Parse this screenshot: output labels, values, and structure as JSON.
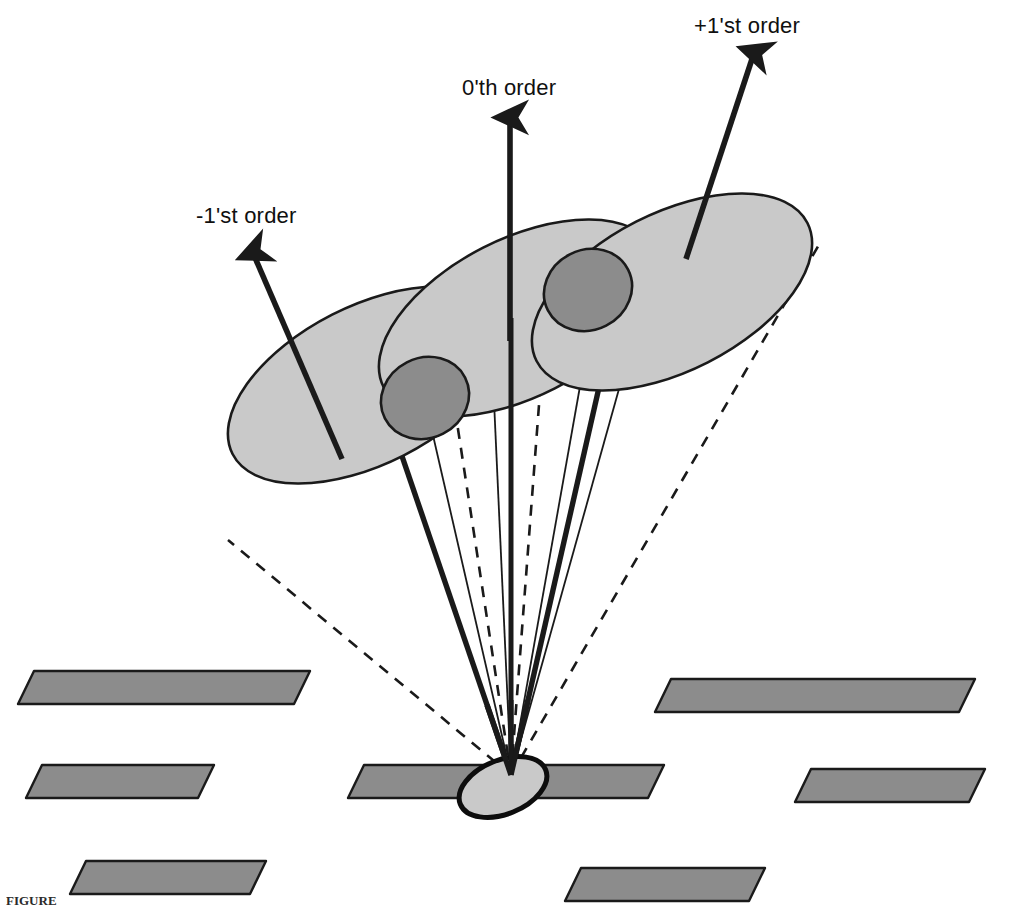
{
  "figure": {
    "domain": "diagram",
    "kind": "optical-diffraction-grating-orders",
    "background_color": "#ffffff",
    "width": 1016,
    "height": 909,
    "caption": "FIGURE"
  },
  "palette": {
    "ink": "#1a1a1a",
    "beam_ellipse_fill": "#c9c9c9",
    "beam_ellipse_stroke": "#1a1a1a",
    "overlap_circle_fill": "#8c8c8c",
    "overlap_circle_stroke": "#1a1a1a",
    "grating_bar_fill": "#8c8c8c",
    "grating_bar_stroke": "#1a1a1a",
    "source_spot_fill": "#c9c9c9",
    "source_spot_stroke": "#0d0d0d"
  },
  "labels": {
    "minus_first_order": "-1'st order",
    "zeroth_order": "0'th order",
    "plus_first_order": "+1'st order"
  },
  "orders": [
    {
      "id": "minus-1",
      "label": "-1'st order",
      "arrow": {
        "x1": 342,
        "y1": 459,
        "x2": 250,
        "y2": 246
      },
      "spot": {
        "cx": 368,
        "cy": 385,
        "rx": 152,
        "ry": 79,
        "rotate": -27
      }
    },
    {
      "id": "zero",
      "label": "0'th order",
      "arrow": {
        "x1": 510,
        "y1": 341,
        "x2": 510,
        "y2": 111
      },
      "spot": {
        "cx": 519,
        "cy": 318,
        "rx": 152,
        "ry": 79,
        "rotate": -27
      }
    },
    {
      "id": "plus-1",
      "label": "+1'st order",
      "arrow": {
        "x1": 686,
        "y1": 259,
        "x2": 757,
        "y2": 46
      },
      "spot": {
        "cx": 672,
        "cy": 292,
        "rx": 152,
        "ry": 79,
        "rotate": -27
      }
    }
  ],
  "overlap_circles": [
    {
      "id": "overlap-left",
      "cx": 425,
      "cy": 398,
      "rx": 45,
      "ry": 40,
      "rotate": -27
    },
    {
      "id": "overlap-right",
      "cx": 588,
      "cy": 290,
      "rx": 45,
      "ry": 40,
      "rotate": -27
    }
  ],
  "apex": {
    "x": 511,
    "y": 775
  },
  "source_spot": {
    "cx": 503,
    "cy": 787,
    "rx": 46,
    "ry": 27,
    "rotate": -22
  },
  "grating_bars": [
    {
      "id": "bar-1",
      "x": 18,
      "y": 671,
      "w": 292,
      "h": 33,
      "skew": 16
    },
    {
      "id": "bar-2",
      "x": 655,
      "y": 679,
      "w": 320,
      "h": 33,
      "skew": 16
    },
    {
      "id": "bar-3",
      "x": 26,
      "y": 765,
      "w": 188,
      "h": 33,
      "skew": 16
    },
    {
      "id": "bar-4",
      "x": 348,
      "y": 765,
      "w": 316,
      "h": 33,
      "skew": 16
    },
    {
      "id": "bar-5",
      "x": 795,
      "y": 769,
      "w": 190,
      "h": 33,
      "skew": 16
    },
    {
      "id": "bar-6",
      "x": 70,
      "y": 861,
      "w": 196,
      "h": 33,
      "skew": 16
    },
    {
      "id": "bar-7",
      "x": 565,
      "y": 868,
      "w": 200,
      "h": 33,
      "skew": 16
    }
  ],
  "cone_rays": {
    "thick_axes": [
      {
        "id": "axis-minus1",
        "x1": 511,
        "y1": 775,
        "x2": 377,
        "y2": 383
      },
      {
        "id": "axis-zero",
        "x1": 511,
        "y1": 775,
        "x2": 511,
        "y2": 318
      },
      {
        "id": "axis-plus1",
        "x1": 511,
        "y1": 775,
        "x2": 620,
        "y2": 295
      }
    ],
    "thin_edges": [
      {
        "id": "thin-minus1-right",
        "x1": 511,
        "y1": 775,
        "x2": 418,
        "y2": 370
      },
      {
        "id": "thin-zero-left",
        "x1": 511,
        "y1": 775,
        "x2": 492,
        "y2": 357
      },
      {
        "id": "thin-plus1-left",
        "x1": 511,
        "y1": 775,
        "x2": 590,
        "y2": 330
      },
      {
        "id": "thin-plus1-right",
        "x1": 511,
        "y1": 775,
        "x2": 645,
        "y2": 296
      }
    ],
    "dashed_edges": [
      {
        "id": "dash-far-left",
        "x1": 511,
        "y1": 775,
        "x2": 228,
        "y2": 540
      },
      {
        "id": "dash-mid-left",
        "x1": 511,
        "y1": 775,
        "x2": 452,
        "y2": 390
      },
      {
        "id": "dash-mid-right",
        "x1": 511,
        "y1": 775,
        "x2": 543,
        "y2": 352
      },
      {
        "id": "dash-far-right",
        "x1": 511,
        "y1": 775,
        "x2": 820,
        "y2": 243
      }
    ]
  }
}
